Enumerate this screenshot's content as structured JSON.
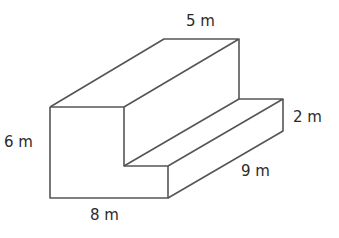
{
  "diagram": {
    "type": "3d-step-prism",
    "labels": {
      "top_depth": "5 m",
      "height": "6 m",
      "step_height": "2 m",
      "length": "9 m",
      "width": "8 m"
    },
    "line_color": "#555555"
  }
}
